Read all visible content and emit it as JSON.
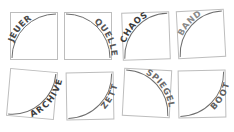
{
  "puzzle": {
    "tiles": [
      {
        "word": "JEUER",
        "color": "#4a4a4a"
      },
      {
        "word": "QUELLE",
        "color": "#555555"
      },
      {
        "word": "CHAOS",
        "color": "#3a3a3a"
      },
      {
        "word": "BAND",
        "color": "#8a8a8a"
      },
      {
        "word": "ARCHIVE",
        "color": "#3d3d3d"
      },
      {
        "word": "ZETT",
        "color": "#5a5a5a"
      },
      {
        "word": "SPIEGEL",
        "color": "#6a6a6a"
      },
      {
        "word": "BOOT",
        "color": "#5e5e5e"
      }
    ]
  }
}
